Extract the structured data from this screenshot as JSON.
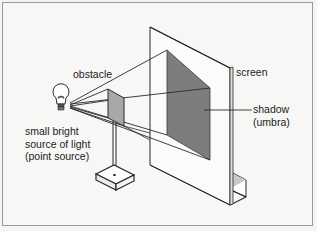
{
  "diagram": {
    "type": "physics-illustration",
    "labels": {
      "obstacle": "obstacle",
      "screen": "screen",
      "shadow": "shadow",
      "umbra": "(umbra)",
      "source_line1": "small bright",
      "source_line2": "source of light",
      "source_line3": "(point source)"
    },
    "icons": {
      "light_source": "light-bulb-icon"
    },
    "colors": {
      "background": "#f7f7f6",
      "line": "#2a2a2a",
      "shadow_fill": "#7d7d7d",
      "obstacle_fill": "#a8a8a8",
      "frame": "#9a9a9a"
    }
  }
}
